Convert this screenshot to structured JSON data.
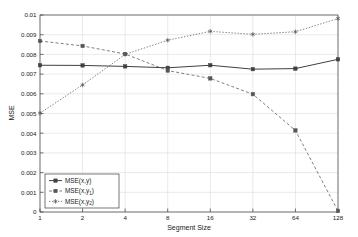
{
  "chart_data": {
    "type": "line",
    "title": "",
    "xlabel": "Segment Size",
    "ylabel": "MSE",
    "x": [
      1,
      2,
      4,
      8,
      16,
      32,
      64,
      128
    ],
    "x_tick_labels": [
      "1",
      "2",
      "4",
      "8",
      "16",
      "32",
      "64",
      "128"
    ],
    "x_scale": "log2",
    "xlim": [
      1,
      128
    ],
    "ylim": [
      0,
      0.01
    ],
    "y_ticks": [
      0,
      0.001,
      0.002,
      0.003,
      0.004,
      0.005,
      0.006,
      0.007,
      0.008,
      0.009,
      0.01
    ],
    "y_tick_labels": [
      "0",
      "0.001",
      "0.002",
      "0.003",
      "0.004",
      "0.005",
      "0.006",
      "0.007",
      "0.008",
      "0.009",
      "0.01"
    ],
    "grid": true,
    "legend_position": "lower-left",
    "series": [
      {
        "name": "MSE(x,y)",
        "label_base": "MSE(x,y",
        "label_sub": "",
        "label_tail": ")",
        "style": "solid",
        "marker": "square",
        "color": "#404040",
        "values": [
          0.00745,
          0.00744,
          0.00739,
          0.00732,
          0.00745,
          0.00725,
          0.00728,
          0.00775
        ]
      },
      {
        "name": "MSE(x,y1)",
        "label_base": "MSE(x,y",
        "label_sub": "1",
        "label_tail": ")",
        "style": "dashed",
        "marker": "square",
        "color": "#555555",
        "values": [
          0.00868,
          0.00843,
          0.00802,
          0.00718,
          0.00678,
          0.00598,
          0.00414,
          5e-05
        ]
      },
      {
        "name": "MSE(x,y2)",
        "label_base": "MSE(x,y",
        "label_sub": "2",
        "label_tail": ")",
        "style": "dotted",
        "marker": "asterisk",
        "color": "#555555",
        "values": [
          0.00502,
          0.00645,
          0.008,
          0.00872,
          0.00917,
          0.00902,
          0.00915,
          0.00982
        ]
      }
    ]
  },
  "legend": {
    "entries": [
      {
        "text": "MSE(x,y)"
      },
      {
        "text": "MSE(x,y1)"
      },
      {
        "text": "MSE(x,y2)"
      }
    ]
  },
  "axes": {
    "x_title": "Segment Size",
    "y_title": "MSE"
  }
}
